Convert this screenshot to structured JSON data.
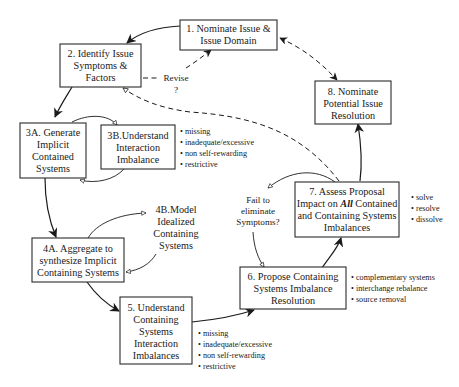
{
  "diagram": {
    "nodes": {
      "n1": {
        "lines": [
          "1. Nominate Issue &",
          "Issue Domain"
        ]
      },
      "n2": {
        "lines": [
          "2. Identify Issue",
          "Symptoms &",
          "Factors"
        ]
      },
      "n3a": {
        "lines": [
          "3A. Generate",
          "Implicit",
          "Contained",
          "Systems"
        ]
      },
      "n3b": {
        "lines": [
          "3B.Understand",
          "Interaction",
          "Imbalance"
        ]
      },
      "n4a": {
        "lines": [
          "4A. Aggregate to",
          "synthesize Implicit",
          "Containing Systems"
        ]
      },
      "n4b": {
        "lines": [
          "4B.Model",
          "Idealized",
          "Containing",
          "Systems"
        ]
      },
      "n5": {
        "lines": [
          "5. Understand",
          "Containing",
          "Systems",
          "Interaction",
          "Imbalances"
        ]
      },
      "n6": {
        "lines": [
          "6. Propose Containing",
          "Systems Imbalance",
          "Resolution"
        ]
      },
      "n7": {
        "line1": "7. Assess Proposal",
        "line2_pre": "Impact on ",
        "line2_em": "All",
        "line2_post": " Contained",
        "line3": "and Containing Systems",
        "line4": "Imbalances"
      },
      "n8": {
        "lines": [
          "8. Nominate",
          "Potential Issue",
          "Resolution"
        ]
      }
    },
    "bullets": {
      "b3b": [
        "• missing",
        "• inadequate/excessive",
        "• non self-rewarding",
        "• restrictive"
      ],
      "b5": [
        "• missing",
        "• inadequate/excessive",
        "• non self-rewarding",
        "• restrictive"
      ],
      "b6": [
        "• complementary systems",
        "• interchange rebalance",
        "• source removal"
      ],
      "b7": [
        "• solve",
        "• resolve",
        "• dissolve"
      ]
    },
    "labels": {
      "revise": [
        "Revise",
        "?"
      ],
      "fail": [
        "Fail to",
        "eliminate",
        "Symptoms?"
      ]
    }
  }
}
